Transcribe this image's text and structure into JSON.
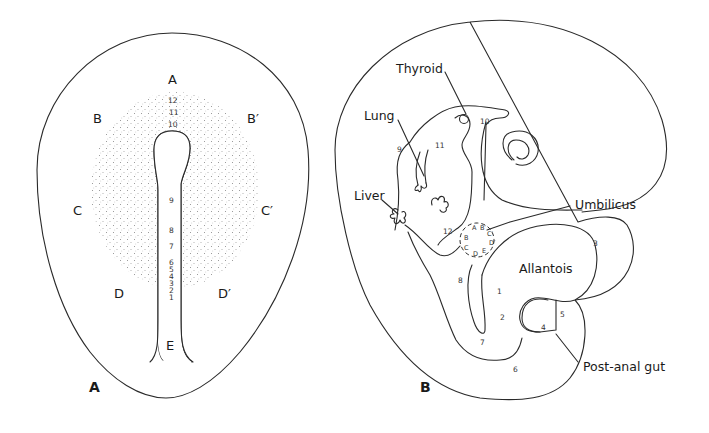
{
  "figure": {
    "panel_a": {
      "panel_label": "A",
      "region_labels": {
        "A": "A",
        "B": "B",
        "B_prime": "B′",
        "C": "C",
        "C_prime": "C′",
        "D": "D",
        "D_prime": "D′",
        "E": "E"
      },
      "level_numbers": [
        "12",
        "11",
        "10",
        "9",
        "8",
        "7",
        "6",
        "5",
        "4",
        "3",
        "2",
        "1"
      ]
    },
    "panel_b": {
      "panel_label": "B",
      "organ_labels": {
        "thyroid": "Thyroid",
        "lung": "Lung",
        "liver": "Liver",
        "umbilicus": "Umbilicus",
        "allantois": "Allantois",
        "post_anal_gut": "Post-anal gut"
      },
      "level_numbers": {
        "n1": "1",
        "n2": "2",
        "n3": "3",
        "n4": "4",
        "n5": "5",
        "n6": "6",
        "n7": "7",
        "n8": "8",
        "n9": "9",
        "n10": "10",
        "n11": "11",
        "n12": "12"
      },
      "umbilical_ring_letters": {
        "A": "A",
        "B_prime": "B′",
        "C_prime": "C′",
        "D_prime": "D′",
        "E": "E",
        "D": "D",
        "C": "C",
        "B": "B"
      }
    },
    "colors": {
      "line": "#2a2a2a",
      "stipple": "#9a9a9a",
      "background": "#ffffff"
    }
  }
}
